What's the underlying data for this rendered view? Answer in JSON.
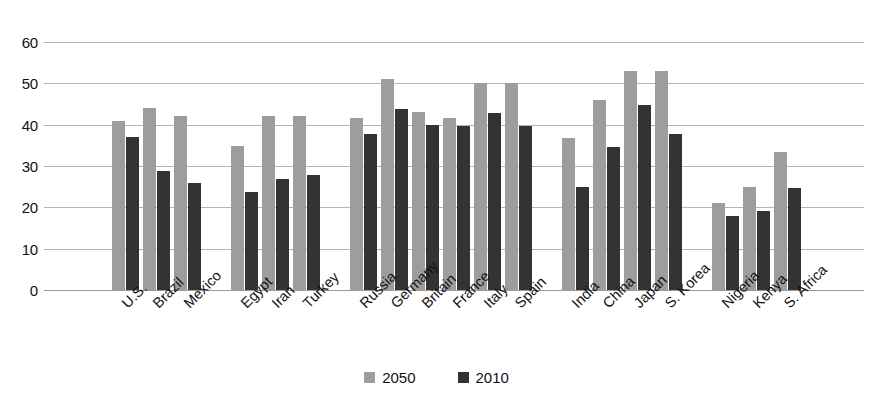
{
  "chart_data": {
    "type": "bar",
    "title": "",
    "subtitle": "",
    "xlabel": "",
    "ylabel": "",
    "ylim": [
      0,
      60
    ],
    "yticks": [
      0,
      10,
      20,
      30,
      40,
      50,
      60
    ],
    "ytick_labels": [
      "0",
      "10",
      "20",
      "30",
      "40",
      "50",
      "60"
    ],
    "grid": true,
    "legend_position": "bottom-center",
    "categories": [
      "U.S.",
      "Brazil",
      "Mexico",
      "Egypt",
      "Iran",
      "Turkey",
      "Russia",
      "Germany",
      "Britain",
      "France",
      "Italy",
      "Spain",
      "India",
      "China",
      "Japan",
      "S. Korea",
      "Nigeria",
      "Kenya",
      "S. Africa"
    ],
    "group_breaks": [
      3,
      6,
      12,
      16
    ],
    "series": [
      {
        "name": "2050",
        "color": "#9d9d9d",
        "values": [
          41,
          44,
          42,
          34.8,
          42,
          42,
          41.7,
          51,
          43,
          41.6,
          50,
          50,
          36.8,
          46,
          53,
          53,
          21,
          25,
          33.5
        ]
      },
      {
        "name": "2010",
        "color": "#333333",
        "values": [
          37,
          28.8,
          25.9,
          23.7,
          26.8,
          27.8,
          37.8,
          43.8,
          40,
          39.7,
          42.8,
          39.8,
          24.9,
          34.7,
          44.7,
          37.8,
          17.9,
          19,
          24.7
        ]
      }
    ]
  },
  "legend": {
    "items": [
      {
        "label": "2050",
        "series_key": "s2050"
      },
      {
        "label": "2010",
        "series_key": "s2010"
      }
    ]
  }
}
